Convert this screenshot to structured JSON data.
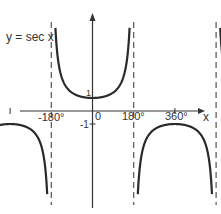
{
  "chart_data": {
    "type": "line",
    "title": "y = sec x",
    "xlabel": "x",
    "ylabel": "",
    "x_ticks": [
      "-180°",
      "0",
      "180°",
      "360°"
    ],
    "y_ticks": [
      "1",
      "-1"
    ],
    "asymptotes_deg": [
      -270,
      -90,
      90,
      270,
      450
    ],
    "xlim_deg": [
      -330,
      500
    ],
    "function": "sec(x)",
    "series": [
      {
        "name": "branch_center_up",
        "x_range_deg": [
          -90,
          90
        ],
        "sign": "positive",
        "min_point": [
          0,
          1
        ]
      },
      {
        "name": "branch_right_up",
        "x_range_deg": [
          270,
          450
        ],
        "sign": "positive",
        "min_point": [
          360,
          1
        ]
      },
      {
        "name": "branch_left_down",
        "x_range_deg": [
          -270,
          -90
        ],
        "sign": "negative",
        "max_point": [
          -180,
          -1
        ]
      },
      {
        "name": "branch_mid_down",
        "x_range_deg": [
          90,
          270
        ],
        "sign": "negative",
        "max_point": [
          180,
          -1
        ]
      }
    ],
    "grid": false
  },
  "labels": {
    "title": "y = sec x",
    "x_axis": "x",
    "tick_neg180": "-180°",
    "tick_0": "0",
    "tick_180": "180°",
    "tick_360": "360°",
    "y_one": "1",
    "y_neg_one": "-1"
  },
  "colors": {
    "curve": "#2a2a2a",
    "axis": "#333333",
    "asymptote": "#555555"
  }
}
